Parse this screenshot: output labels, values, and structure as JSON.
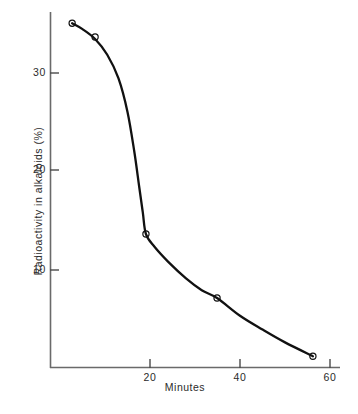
{
  "chart_data": {
    "type": "line",
    "title": "",
    "subtitle": "",
    "xlabel": "Minutes",
    "ylabel": "Radioactivity in alkaloids (%)",
    "xlim": [
      0,
      60
    ],
    "ylim": [
      0,
      37
    ],
    "xticks": [
      20,
      40,
      60
    ],
    "xtick_labels": [
      "20",
      "40",
      "60"
    ],
    "yticks": [
      10,
      20,
      30
    ],
    "ytick_labels": [
      "10",
      "20",
      "30"
    ],
    "grid": false,
    "legend": false,
    "marker": "open-circle",
    "line_color": "#111111",
    "marker_color": "#111111",
    "axis_color": "#555555",
    "background": "#ffffff",
    "series": [
      {
        "name": "Radioactivity in alkaloids",
        "x": [
          2.7,
          7.8,
          19.1,
          34.9,
          56.2
        ],
        "values": [
          35.0,
          33.6,
          13.6,
          7.1,
          1.2
        ]
      }
    ],
    "curve_points": [
      [
        2.7,
        35.0
      ],
      [
        5.0,
        34.4
      ],
      [
        7.8,
        33.4
      ],
      [
        10.5,
        31.8
      ],
      [
        13.0,
        29.4
      ],
      [
        15.0,
        26.0
      ],
      [
        16.5,
        22.0
      ],
      [
        17.6,
        18.4
      ],
      [
        18.4,
        15.8
      ],
      [
        19.1,
        13.6
      ],
      [
        21.0,
        12.3
      ],
      [
        24.0,
        10.8
      ],
      [
        28.0,
        9.1
      ],
      [
        31.5,
        7.9
      ],
      [
        34.9,
        7.1
      ],
      [
        40.0,
        5.3
      ],
      [
        45.0,
        3.9
      ],
      [
        50.0,
        2.6
      ],
      [
        56.2,
        1.2
      ]
    ]
  }
}
